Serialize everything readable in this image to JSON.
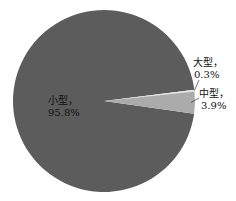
{
  "chart_data": {
    "type": "pie",
    "title": "",
    "slices": [
      {
        "name": "小型",
        "value": 95.8,
        "label_line1": "小型，",
        "label_line2": "95.8%",
        "color": "#5c5c5c"
      },
      {
        "name": "大型",
        "value": 0.3,
        "label_line1": "大型，",
        "label_line2": "0.3%",
        "color": "#e6e6e6"
      },
      {
        "name": "中型",
        "value": 3.9,
        "label_line1": "中型，",
        "label_line2": "3.9%",
        "color": "#ababab"
      }
    ],
    "legend": "none"
  }
}
